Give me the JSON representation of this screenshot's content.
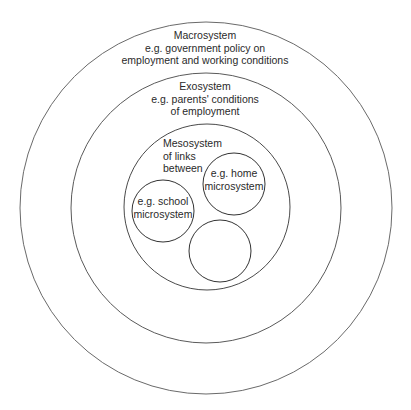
{
  "diagram": {
    "type": "nested-circles",
    "stroke_color": "#555555",
    "background": "#ffffff",
    "macrosystem": {
      "title": "Macrosystem",
      "line1": "e.g. government policy on",
      "line2": "employment and working conditions"
    },
    "exosystem": {
      "title": "Exosystem",
      "line1": "e.g. parents' conditions",
      "line2": "of employment"
    },
    "mesosystem": {
      "title": "Mesosystem",
      "line1": "of links",
      "line2": "between"
    },
    "microsystems": [
      {
        "line1": "e.g. home",
        "line2": "microsystem"
      },
      {
        "line1": "e.g. school",
        "line2": "microsystem"
      },
      {
        "line1": "",
        "line2": ""
      }
    ]
  }
}
